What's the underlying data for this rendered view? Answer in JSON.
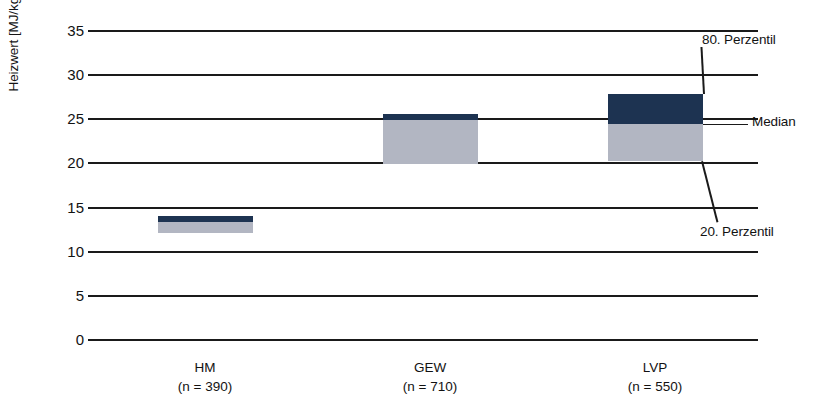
{
  "chart_data": {
    "type": "bar",
    "title": "",
    "subtitle": "",
    "xlabel": "",
    "ylabel": "Heizwert [MJ/kg FS]",
    "ylim": [
      0,
      35
    ],
    "ytick_step": 5,
    "yticks": [
      "35",
      "30",
      "25",
      "20",
      "15",
      "10",
      "5",
      "0"
    ],
    "grid": true,
    "legend_position": "annotations-right",
    "categories": [
      "HM",
      "GEW",
      "LVP"
    ],
    "category_counts": [
      "(n = 390)",
      "(n = 710)",
      "(n = 550)"
    ],
    "series": [
      {
        "name": "20. Perzentil",
        "values": [
          12.0,
          19.8,
          20.2
        ]
      },
      {
        "name": "Median",
        "values": [
          13.3,
          24.8,
          24.4
        ]
      },
      {
        "name": "80. Perzentil",
        "values": [
          13.9,
          25.5,
          27.7
        ]
      }
    ],
    "boxes": [
      {
        "category": "HM",
        "count": "(n = 390)",
        "p20": 12.0,
        "median": 13.3,
        "p80": 13.9
      },
      {
        "category": "GEW",
        "count": "(n = 710)",
        "p20": 19.8,
        "median": 24.8,
        "p80": 25.5
      },
      {
        "category": "LVP",
        "count": "(n = 550)",
        "p20": 20.2,
        "median": 24.4,
        "p80": 27.7
      }
    ],
    "annotations": [
      {
        "name": "p80-annotation",
        "label": "80. Perzentil"
      },
      {
        "name": "median-annotation",
        "label": "Median"
      },
      {
        "name": "p20-annotation",
        "label": "20. Perzentil"
      }
    ],
    "colors": {
      "upper_band": "#1d3351",
      "lower_band": "#b2b6c2",
      "gridline": "#1a1a1a",
      "text": "#121212",
      "background": "#ffffff"
    }
  },
  "axis": {
    "y_title": "Heizwert [MJ/kg FS]",
    "ticks": [
      {
        "value": "35"
      },
      {
        "value": "30"
      },
      {
        "value": "25"
      },
      {
        "value": "20"
      },
      {
        "value": "15"
      },
      {
        "value": "10"
      },
      {
        "value": "5"
      },
      {
        "value": "0"
      }
    ]
  },
  "categories": [
    {
      "name": "HM",
      "count": "(n = 390)"
    },
    {
      "name": "GEW",
      "count": "(n = 710)"
    },
    {
      "name": "LVP",
      "count": "(n = 550)"
    }
  ],
  "annotations": {
    "p80": "80. Perzentil",
    "median": "Median",
    "p20": "20. Perzentil"
  }
}
